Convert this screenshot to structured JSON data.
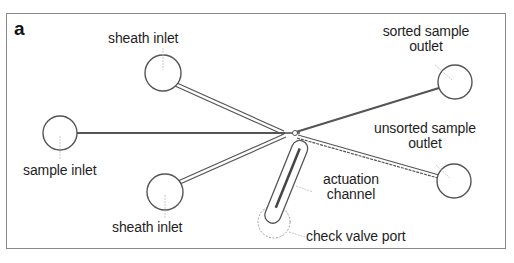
{
  "panel_label": "a",
  "colors": {
    "frame": "#8a8a8a",
    "channel": "#555555",
    "text": "#1e1e1e",
    "background": "#ffffff"
  },
  "ports": [
    {
      "id": "sheath-inlet-top",
      "label": "sheath inlet",
      "cx": 163,
      "cy": 73,
      "r": 18
    },
    {
      "id": "sample-inlet",
      "label": "sample inlet",
      "cx": 60,
      "cy": 133,
      "r": 17
    },
    {
      "id": "sheath-inlet-bottom",
      "label": "sheath inlet",
      "cx": 165,
      "cy": 192,
      "r": 18
    },
    {
      "id": "sorted-sample-outlet",
      "label_line1": "sorted sample",
      "label_line2": "outlet",
      "cx": 455,
      "cy": 82,
      "r": 17
    },
    {
      "id": "unsorted-sample-outlet",
      "label_line1": "unsorted sample",
      "label_line2": "outlet",
      "cx": 454,
      "cy": 181,
      "r": 17
    },
    {
      "id": "check-valve-port",
      "label": "check valve port",
      "cx": 274,
      "cy": 222,
      "r": 16
    }
  ],
  "actuation": {
    "label_line1": "actuation",
    "label_line2": "channel"
  },
  "junction": {
    "x": 293,
    "y": 133
  }
}
